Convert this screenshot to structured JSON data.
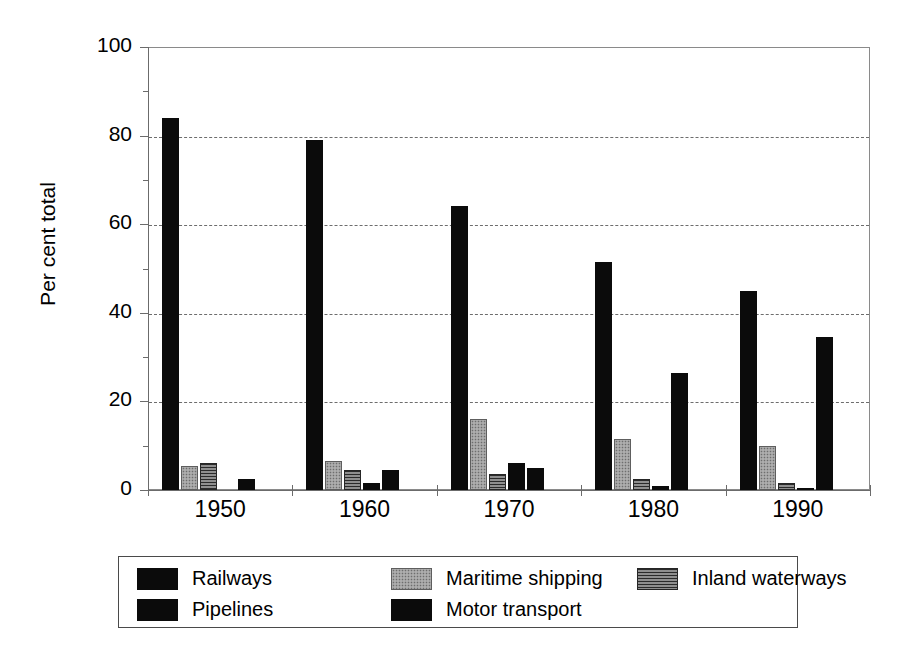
{
  "chart_data": {
    "type": "bar",
    "title": "",
    "xlabel": "",
    "ylabel": "Per cent total",
    "categories": [
      "1950",
      "1960",
      "1970",
      "1980",
      "1990"
    ],
    "ylim": [
      0,
      100
    ],
    "yticks": [
      0,
      20,
      40,
      60,
      80,
      100
    ],
    "yticklabels": [
      "0",
      "20",
      "40",
      "60",
      "80",
      "100"
    ],
    "minor_yticks": [
      10,
      30,
      50,
      70,
      90
    ],
    "grid": "horizontal-dashed",
    "legend_position": "below-plot",
    "series": [
      {
        "name": "Railways",
        "pattern": "solid-black",
        "color": "#0b0b0b",
        "values": [
          84,
          79,
          64,
          51.5,
          45
        ]
      },
      {
        "name": "Maritime shipping",
        "pattern": "light-speckled-gray",
        "color": "#9e9e9e",
        "values": [
          5.5,
          6.5,
          16,
          11.5,
          10
        ]
      },
      {
        "name": "Inland waterways",
        "pattern": "dark-gray-horizontal-hatch",
        "color": "#585858",
        "values": [
          6,
          4.5,
          3.5,
          2.5,
          1.5
        ]
      },
      {
        "name": "Pipelines",
        "pattern": "solid-black",
        "color": "#0b0b0b",
        "values": [
          0,
          1.5,
          6,
          1,
          0.5
        ]
      },
      {
        "name": "Motor transport",
        "pattern": "solid-black",
        "color": "#0b0b0b",
        "values": [
          2.5,
          4.5,
          5,
          26.5,
          34.5
        ]
      }
    ]
  },
  "legend": {
    "entries": [
      {
        "label": "Railways",
        "swatch": "solid-black"
      },
      {
        "label": "Maritime shipping",
        "swatch": "light-speckled-gray"
      },
      {
        "label": "Inland waterways",
        "swatch": "dark-gray-horizontal-hatch"
      },
      {
        "label": "Pipelines",
        "swatch": "solid-black"
      },
      {
        "label": "Motor transport",
        "swatch": "solid-black"
      }
    ]
  }
}
